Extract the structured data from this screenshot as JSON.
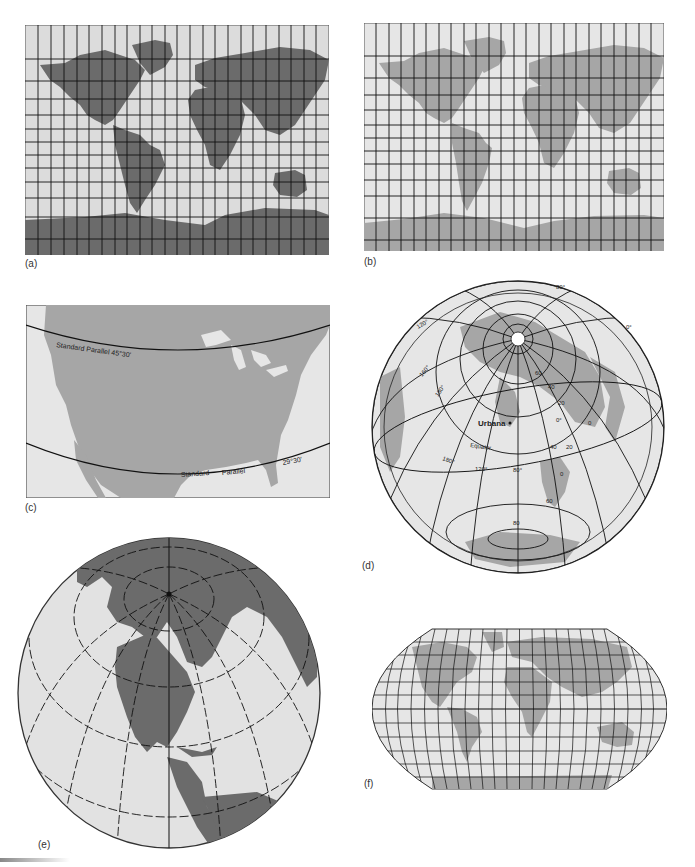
{
  "figure": {
    "panels": [
      {
        "id": "a",
        "label": "(a)",
        "type": "rectangular-world-map",
        "land_color": "#6e6e6e",
        "water_color": "#dcdcdc"
      },
      {
        "id": "b",
        "label": "(b)",
        "type": "rectangular-world-map",
        "land_color": "#a8a8a8",
        "water_color": "#e6e6e6"
      },
      {
        "id": "c",
        "label": "(c)",
        "type": "conic-us-map",
        "annotations": {
          "upper_parallel": "Standard Parallel 45°30'",
          "lower_parallel_left": "Standard",
          "lower_parallel_mid": "Parallel",
          "lower_parallel_right": "29°30'"
        }
      },
      {
        "id": "d",
        "label": "(d)",
        "type": "azimuthal-centered-urbana",
        "annotations": {
          "city": "Urbana",
          "equator": "Equator",
          "lat_labels": [
            "80°",
            "0°",
            "60",
            "40",
            "20",
            "0°",
            "0",
            "20",
            "40",
            "0",
            "60",
            "80"
          ],
          "lon_labels": [
            "120°",
            "160°",
            "180°",
            "180°",
            "160°",
            "120°",
            "80°"
          ]
        }
      },
      {
        "id": "e",
        "label": "(e)",
        "type": "orthographic-globe"
      },
      {
        "id": "f",
        "label": "(f)",
        "type": "robinson-world-map"
      }
    ],
    "colors": {
      "land_dark": "#6b6b6b",
      "land_light": "#a6a6a6",
      "water": "#e2e2e2",
      "grid": "#111111",
      "outline": "#555555"
    }
  }
}
